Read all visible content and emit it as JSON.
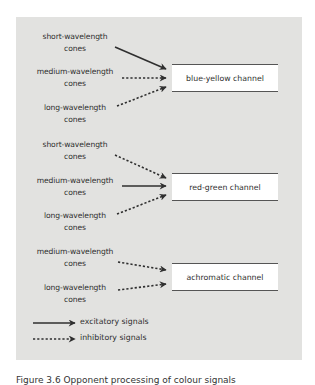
{
  "diagram": {
    "sections": [
      {
        "channel": "blue-yellow channel",
        "inputs": [
          {
            "line1": "short-wavelength",
            "line2": "cones",
            "signal": "excitatory"
          },
          {
            "line1": "medium-wavelength",
            "line2": "cones",
            "signal": "inhibitory"
          },
          {
            "line1": "long-wavelength",
            "line2": "cones",
            "signal": "inhibitory"
          }
        ]
      },
      {
        "channel": "red-green channel",
        "inputs": [
          {
            "line1": "short-wavelength",
            "line2": "cones",
            "signal": "inhibitory"
          },
          {
            "line1": "medium-wavelength",
            "line2": "cones",
            "signal": "excitatory"
          },
          {
            "line1": "long-wavelength",
            "line2": "cones",
            "signal": "inhibitory"
          }
        ]
      },
      {
        "channel": "achromatic channel",
        "inputs": [
          {
            "line1": "medium-wavelength",
            "line2": "cones",
            "signal": "inhibitory"
          },
          {
            "line1": "long-wavelength",
            "line2": "cones",
            "signal": "inhibitory"
          }
        ]
      }
    ],
    "legend": {
      "excitatory": "excitatory signals",
      "inhibitory": "inhibitory signals"
    },
    "caption": "Figure 3.6  Opponent processing of colour signals",
    "colors": {
      "panel_bg": "#e2e2e0",
      "arrow": "#2f2f2f",
      "box_fill": "#ffffff"
    }
  }
}
